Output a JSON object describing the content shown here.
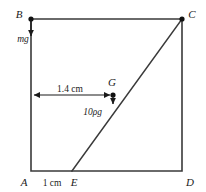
{
  "figure": {
    "background_color": "#ffffff",
    "line_color": "#3a3a3a",
    "text_color": "#1a1a1a"
  },
  "vertices": {
    "b": "B",
    "c": "C",
    "a": "A",
    "d": "D",
    "e": "E",
    "g": "G"
  },
  "forces": {
    "weight": "mg",
    "buoyancy": "10ρg"
  },
  "dimensions": {
    "horizontal": "1.4 cm",
    "base": "1 cm"
  },
  "geometry": {
    "rect": {
      "left": 31,
      "top": 19,
      "right": 182,
      "bottom": 171
    },
    "point_e_x": 72,
    "point_g": {
      "x": 113,
      "y": 95
    },
    "dim_line_y": 95,
    "mg_arrow": {
      "x": 31,
      "y_start": 19,
      "y_end": 43
    },
    "buoyancy_arrow": {
      "x": 113,
      "y_start": 95,
      "y_end": 111
    }
  }
}
